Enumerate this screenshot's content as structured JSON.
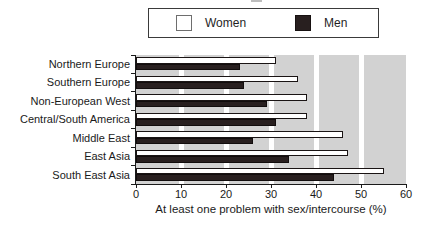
{
  "legend": {
    "items": [
      {
        "label": "Women",
        "color": "#ffffff"
      },
      {
        "label": "Men",
        "color": "#281f1f"
      }
    ]
  },
  "chart_data": {
    "type": "bar",
    "orientation": "horizontal",
    "title": "",
    "xlabel": "At least one problem with sex/intercourse (%)",
    "ylabel": "",
    "xlim": [
      0,
      60
    ],
    "xticks": [
      0,
      10,
      20,
      30,
      40,
      50,
      60
    ],
    "grid": "white vertical gridlines every 10 on gray plot background",
    "plot_background": "#d2d2d2",
    "legend_position": "top",
    "categories": [
      "Northern Europe",
      "Southern Europe",
      "Non-European West",
      "Central/South America",
      "Middle East",
      "East Asia",
      "South East Asia"
    ],
    "series": [
      {
        "name": "Women",
        "color": "#ffffff",
        "values": [
          31,
          36,
          38,
          38,
          46,
          47,
          55
        ]
      },
      {
        "name": "Men",
        "color": "#281f1f",
        "values": [
          23,
          24,
          29,
          31,
          26,
          34,
          44
        ]
      }
    ]
  }
}
